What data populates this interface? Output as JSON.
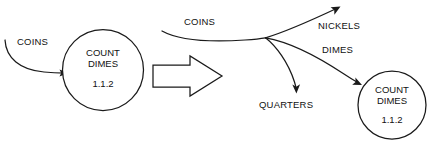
{
  "diagram": {
    "background_color": "#ffffff",
    "line_color": "#1a1a1a",
    "left": {
      "process": {
        "line1": "COUNT",
        "line2": "DIMES",
        "id": "1.1.2"
      },
      "input_flow_label": "COINS"
    },
    "transform_arrow": {
      "glyph": "block-arrow-right"
    },
    "right": {
      "source_flow_label": "COINS",
      "branches": [
        {
          "label": "NICKELS"
        },
        {
          "label": "DIMES"
        },
        {
          "label": "QUARTERS"
        }
      ],
      "process": {
        "line1": "COUNT",
        "line2": "DIMES",
        "id": "1.1.2"
      }
    }
  }
}
